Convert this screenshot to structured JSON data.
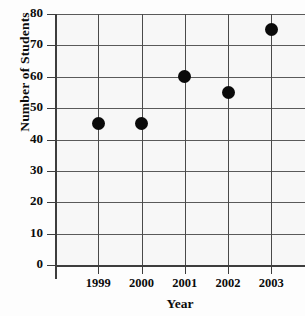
{
  "chart_data": {
    "type": "scatter",
    "title": "",
    "xlabel": "Year",
    "ylabel": "Number of Students",
    "categories": [
      "1999",
      "2000",
      "2001",
      "2002",
      "2003"
    ],
    "values": [
      45,
      45,
      60,
      55,
      75
    ],
    "series": [
      {
        "name": "Number of Students",
        "values": [
          45,
          45,
          60,
          55,
          75
        ]
      }
    ],
    "ylim": [
      0,
      80
    ],
    "y_ticks": [
      0,
      10,
      20,
      30,
      40,
      50,
      60,
      70,
      80
    ],
    "y_tick_labels": [
      "0",
      "10",
      "20",
      "30",
      "40",
      "50",
      "60",
      "70",
      "80"
    ],
    "grid": true,
    "legend": "none",
    "marker": "filled-circle",
    "marker_color": "#0a0a0a",
    "gridline_color": "#5a5a5a",
    "background_color": "#f7f7f7"
  }
}
